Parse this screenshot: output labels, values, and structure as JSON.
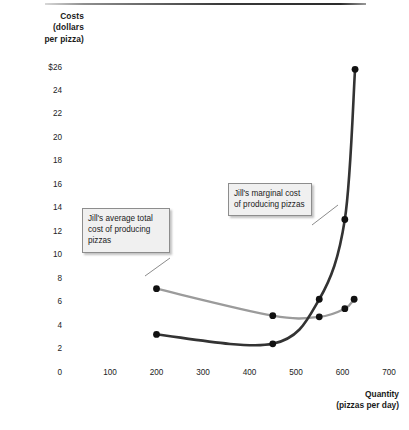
{
  "figure": {
    "y_axis_title": "Costs\n(dollars\nper pizza)",
    "x_axis_title": "Quantity\n(pizzas per day)"
  },
  "callouts": {
    "atc": "Jill's average total cost of producing pizzas",
    "mc": "Jill's marginal cost of producing pizzas"
  },
  "chart_data": {
    "type": "line",
    "title": "",
    "xlabel": "Quantity (pizzas per day)",
    "ylabel": "Costs (dollars per pizza)",
    "xlim": [
      0,
      700
    ],
    "ylim": [
      0,
      26
    ],
    "grid": false,
    "legend": "annotations",
    "x_ticks": [
      100,
      200,
      300,
      400,
      500,
      600,
      700
    ],
    "x_tick_labels": [
      "100",
      "200",
      "300",
      "400",
      "500",
      "600",
      "700"
    ],
    "y_ticks": [
      0,
      2,
      4,
      6,
      8,
      10,
      12,
      14,
      16,
      18,
      20,
      22,
      24,
      26
    ],
    "y_tick_labels": [
      "0",
      "2",
      "4",
      "6",
      "8",
      "10",
      "12",
      "14",
      "16",
      "18",
      "20",
      "22",
      "24",
      "$26"
    ],
    "series": [
      {
        "name": "Jill's average total cost of producing pizzas",
        "color": "#9b9b9b",
        "marker": "circle",
        "marker_color": "#111111",
        "x": [
          200,
          450,
          550,
          605,
          625
        ],
        "values": [
          7.1,
          4.8,
          4.7,
          5.4,
          6.2
        ]
      },
      {
        "name": "Jill's marginal cost of producing pizzas",
        "color": "#333333",
        "marker": "circle",
        "marker_color": "#111111",
        "x": [
          200,
          450,
          550,
          605,
          627
        ],
        "values": [
          3.2,
          2.4,
          6.2,
          13.0,
          25.8
        ]
      }
    ]
  }
}
